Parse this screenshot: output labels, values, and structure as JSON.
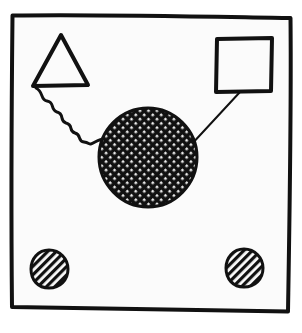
{
  "figure": {
    "title": "Hand-drawn diagram with frame, triangle, square, hatched circles",
    "style": "hand-drawn ink sketch, black on off-white",
    "canvas": {
      "width": 302,
      "height": 333
    },
    "colors": {
      "page_background": "#ffffff",
      "panel_background": "#fbfbfb",
      "ink": "#111111",
      "hatch": "#111111"
    },
    "frame": {
      "name": "outer frame",
      "shape": "irregular hand-drawn rectangle",
      "stroke_width": 4,
      "corners": [
        {
          "x": 12,
          "y": 15
        },
        {
          "x": 291,
          "y": 18
        },
        {
          "x": 288,
          "y": 312
        },
        {
          "x": 12,
          "y": 307
        }
      ]
    },
    "nodes": [
      {
        "id": "triangle",
        "label": "triangle",
        "shape": "triangle",
        "fill": "none",
        "stroke_width": 4,
        "points": [
          {
            "x": 61,
            "y": 35
          },
          {
            "x": 88,
            "y": 85
          },
          {
            "x": 33,
            "y": 86
          }
        ]
      },
      {
        "id": "square",
        "label": "square",
        "shape": "square",
        "fill": "none",
        "stroke_width": 4,
        "x": 216,
        "y": 38,
        "width": 56,
        "height": 54
      },
      {
        "id": "center-circle",
        "label": "cross-hatched circle",
        "shape": "circle",
        "fill": "crosshatch",
        "hatch_pattern": "dense diagonal grid",
        "hatch_spacing": 6,
        "stroke_width": 3,
        "cx": 148,
        "cy": 157,
        "r": 49
      },
      {
        "id": "circle-bottom-left",
        "label": "hatched small circle (left)",
        "shape": "circle",
        "fill": "diagonal-hatch",
        "hatch_pattern": "parallel diagonal lines",
        "hatch_spacing": 6,
        "stroke_width": 3,
        "cx": 49,
        "cy": 269,
        "r": 19
      },
      {
        "id": "circle-bottom-right",
        "label": "hatched small circle (right)",
        "shape": "circle",
        "fill": "diagonal-hatch",
        "hatch_pattern": "parallel diagonal lines",
        "hatch_spacing": 6,
        "stroke_width": 3,
        "cx": 244,
        "cy": 268,
        "r": 19
      }
    ],
    "connectors": [
      {
        "id": "wavy-connector",
        "label": "wavy line from triangle to circle",
        "style": "squiggle",
        "stroke_width": 3,
        "from": "triangle",
        "to": "center-circle",
        "start": {
          "x": 36,
          "y": 88
        },
        "end": {
          "x": 104,
          "y": 139
        }
      },
      {
        "id": "straight-connector",
        "label": "straight line from square to circle",
        "style": "straight",
        "stroke_width": 2,
        "from": "square",
        "to": "center-circle",
        "start": {
          "x": 240,
          "y": 92
        },
        "end": {
          "x": 190,
          "y": 146
        }
      }
    ]
  }
}
